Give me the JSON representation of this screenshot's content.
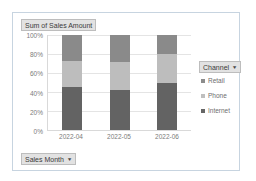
{
  "value_field_button": {
    "label": "Sum of Sales Amount"
  },
  "row_field_button": {
    "label": "Sales Month",
    "arrow": "▼"
  },
  "legend_field_button": {
    "label": "Channel",
    "arrow": "▼"
  },
  "legend": {
    "items": [
      {
        "label": "Retail",
        "marker": "legend-swatch-retail",
        "color": "#8c8c8c"
      },
      {
        "label": "Phone",
        "marker": "legend-swatch-phone",
        "color": "#bfbfbf"
      },
      {
        "label": "Internet",
        "marker": "legend-swatch-internet",
        "color": "#666666"
      }
    ]
  },
  "colors": {
    "retail": "#8a8a8a",
    "phone": "#bdbdbd",
    "internet": "#636363",
    "gridline": "#e4e4e4",
    "axis": "#d9d9d9",
    "frame_border": "#c7d4e0",
    "field_button_bg": "#e2e2e2",
    "tick_text": "#7b7b7b"
  },
  "chart_data": {
    "type": "bar",
    "stacked": true,
    "normalized": true,
    "title": "Sum of Sales Amount",
    "xlabel": "Sales Month",
    "ylabel": "",
    "legend_title": "Channel",
    "legend_position": "right",
    "grid": true,
    "ylim": [
      0,
      100
    ],
    "ytick_labels": [
      "100%",
      "80%",
      "60%",
      "40%",
      "20%",
      "0%"
    ],
    "ytick_values": [
      100,
      80,
      60,
      40,
      20,
      0
    ],
    "categories": [
      "2022-04",
      "2022-05",
      "2022-06"
    ],
    "series": [
      {
        "name": "Internet",
        "values": [
          45,
          42,
          50
        ]
      },
      {
        "name": "Phone",
        "values": [
          28,
          30,
          30
        ]
      },
      {
        "name": "Retail",
        "values": [
          27,
          28,
          20
        ]
      }
    ]
  }
}
